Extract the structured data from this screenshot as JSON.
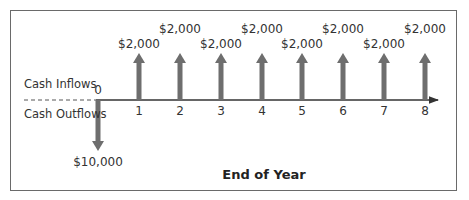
{
  "diagram": {
    "type": "cash-flow-timeline",
    "labels": {
      "inflows": "Cash Inflows",
      "outflows": "Cash Outflows",
      "x_axis": "End of Year"
    },
    "periods": [
      "0",
      "1",
      "2",
      "3",
      "4",
      "5",
      "6",
      "7",
      "8"
    ],
    "outflow": {
      "period": "0",
      "amount": "$10,000"
    },
    "inflows": [
      {
        "period": "1",
        "amount": "$2,000"
      },
      {
        "period": "2",
        "amount": "$2,000"
      },
      {
        "period": "3",
        "amount": "$2,000"
      },
      {
        "period": "4",
        "amount": "$2,000"
      },
      {
        "period": "5",
        "amount": "$2,000"
      },
      {
        "period": "6",
        "amount": "$2,000"
      },
      {
        "period": "7",
        "amount": "$2,000"
      },
      {
        "period": "8",
        "amount": "$2,000"
      }
    ],
    "colors": {
      "arrow": "#6e6e6e",
      "axis": "#333333",
      "frame": "#6a6a6a"
    }
  }
}
